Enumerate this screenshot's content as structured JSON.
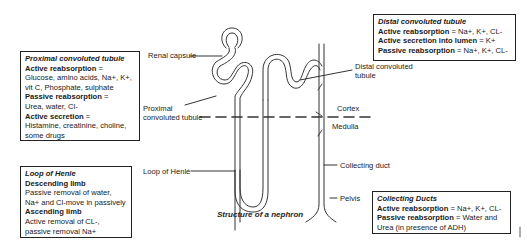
{
  "caption": "Structure of a nephron",
  "labels": {
    "renal_capsule": "Renal capsule",
    "proximal_1": "Proximal",
    "proximal_2": "convoluted tubule",
    "distal_1": "Distal convoluted",
    "distal_2": "tubule",
    "cortex": "Cortex",
    "medulla": "Medulla",
    "loop_of_henle": "Loop of Henlé",
    "collecting_duct": "Collecting duct",
    "pelvis": "Pelvis"
  },
  "boxes": {
    "proximal": {
      "title": "Proximal convoluted tubule",
      "active_reabsorption_label": "Active reabsorption",
      "active_reabsorption_eq": " =",
      "active_reabsorption_value": "Glucose, amino acids, Na+, K+, vit C, Phosphate, sulphate",
      "passive_reabsorption_label": "Passive reabsorption",
      "passive_reabsorption_eq": " =",
      "passive_reabsorption_value": "Urea, water, Cl-",
      "active_secretion_label": "Active secretion",
      "active_secretion_eq": " =",
      "active_secretion_value": "Histamine, creatinine, choline, some drugs"
    },
    "loop": {
      "title": "Loop of Henle",
      "descending_label": "Descending limb",
      "descending_value": "Passive removal of water, Na+ and Cl-move in passively",
      "ascending_label": "Ascending limb",
      "ascending_value": "Active removal of CL-, passive removal Na+"
    },
    "distal": {
      "title": "Distal convoluted tubule",
      "active_reabsorption_label": "Active reabsorption",
      "active_reabsorption_value": " = Na+, K+, CL-",
      "active_secretion_label": "Active secretion into lumen",
      "active_secretion_value": " = K+",
      "passive_reabsorption_label": "Passive reabsorption",
      "passive_reabsorption_value": " = Na+, K+, CL-"
    },
    "collecting": {
      "title": "Collecting Ducts",
      "active_reabsorption_label": "Active reabsorption",
      "active_reabsorption_value": " = Na+, K+, CL-",
      "passive_reabsorption_label": "Passive reabsorption",
      "passive_reabsorption_value": " = Water and Urea (in presence of ADH)"
    }
  }
}
